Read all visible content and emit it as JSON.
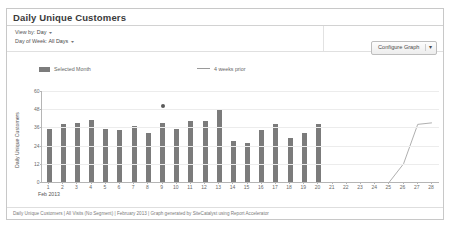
{
  "panel": {
    "title": "Daily Unique Customers"
  },
  "controls": {
    "view_by_label": "View by:",
    "view_by_value": "Day",
    "day_of_week_label": "Day of Week:",
    "day_of_week_value": "All Days",
    "caret": "▾",
    "configure_button": "Configure Graph",
    "configure_caret": "▾"
  },
  "legend": {
    "items": [
      {
        "label": "Selected Month",
        "swatch": "bar",
        "color": "#7c7c7c"
      },
      {
        "label": "4 weeks prior",
        "swatch": "line",
        "color": "#9a9a9a"
      }
    ]
  },
  "footer": {
    "text": "Daily Unique Customers | All Visits (No Segment) | February 2013 | Graph generated by SiteCatalyst using Report Accelerator"
  },
  "chart_data": {
    "type": "bar",
    "title": "Daily Unique Customers",
    "xlabel": "Feb 2013",
    "ylabel": "Daily Unique Customers",
    "ylim": [
      0,
      60
    ],
    "yticks": [
      0,
      12,
      24,
      36,
      48,
      60
    ],
    "grid": true,
    "legend_position": "top",
    "categories": [
      "1",
      "2",
      "3",
      "4",
      "5",
      "6",
      "7",
      "8",
      "9",
      "10",
      "11",
      "12",
      "13",
      "14",
      "15",
      "16",
      "17",
      "18",
      "19",
      "20",
      "21",
      "22",
      "23",
      "24",
      "25",
      "26",
      "27",
      "28"
    ],
    "series": [
      {
        "name": "Selected Month",
        "type": "bar",
        "color": "#7b7b7b",
        "values": [
          35,
          38,
          39,
          41,
          35,
          34,
          37,
          32,
          39,
          35,
          40,
          40,
          48,
          27,
          26,
          34,
          38,
          29,
          32,
          38,
          0,
          0,
          0,
          0,
          0,
          0,
          0,
          0
        ]
      },
      {
        "name": "4 weeks prior",
        "type": "line",
        "color": "#9a9a9a",
        "values": [
          null,
          null,
          null,
          null,
          null,
          null,
          null,
          null,
          null,
          null,
          null,
          null,
          null,
          null,
          null,
          null,
          null,
          null,
          null,
          null,
          null,
          null,
          null,
          null,
          0,
          12,
          38,
          39
        ]
      }
    ],
    "annotations": [
      {
        "type": "point-marker",
        "x": "9",
        "y": 50,
        "color": "#5a5a5a"
      }
    ]
  }
}
